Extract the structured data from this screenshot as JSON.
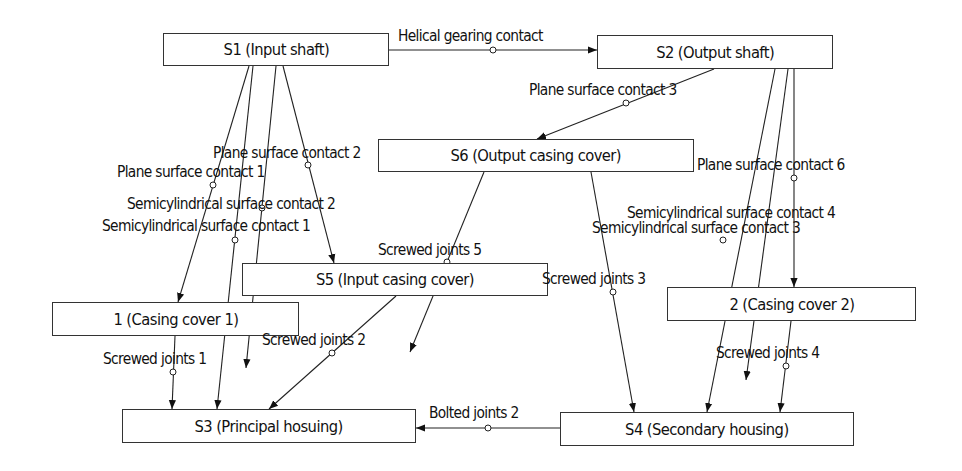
{
  "diagram": {
    "type": "assembly-liaison-graph",
    "nodes": [
      {
        "id": "S1",
        "label": "S1 (Input shaft)",
        "x": 163,
        "y": 33,
        "w": 226,
        "h": 33
      },
      {
        "id": "S2",
        "label": "S2 (Output shaft)",
        "x": 597,
        "y": 35,
        "w": 236,
        "h": 34
      },
      {
        "id": "S6",
        "label": "S6 (Output casing cover)",
        "x": 378,
        "y": 139,
        "w": 316,
        "h": 33
      },
      {
        "id": "S5",
        "label": "S5 (Input casing cover)",
        "x": 242,
        "y": 263,
        "w": 306,
        "h": 33
      },
      {
        "id": "C1",
        "label": "1 (Casing cover 1)",
        "x": 52,
        "y": 302,
        "w": 247,
        "h": 34
      },
      {
        "id": "C2",
        "label": "2 (Casing cover 2)",
        "x": 667,
        "y": 287,
        "w": 249,
        "h": 34
      },
      {
        "id": "S3",
        "label": "S3 (Principal hosuing)",
        "x": 122,
        "y": 409,
        "w": 294,
        "h": 34
      },
      {
        "id": "S4",
        "label": "S4 (Secondary housing)",
        "x": 560,
        "y": 412,
        "w": 294,
        "h": 34
      }
    ],
    "edges": [
      {
        "label": "Helical gearing contact",
        "from": "S1",
        "to": "S2",
        "x1": 389,
        "y1": 50,
        "x2": 597,
        "y2": 50,
        "mx": 493,
        "my": 50,
        "lx": 398,
        "ly": 28
      },
      {
        "label": "Plane surface contact 3",
        "from": "S2",
        "to": "S6",
        "x1": 714,
        "y1": 69,
        "x2": 537,
        "y2": 139,
        "mx": 626,
        "my": 103,
        "lx": 529,
        "ly": 82
      },
      {
        "label": "Plane surface contact 1",
        "from": "S1",
        "to": "C1",
        "x1": 249,
        "y1": 66,
        "x2": 178,
        "y2": 302,
        "mx": 213,
        "my": 185,
        "lx": 117,
        "ly": 164
      },
      {
        "label": "Semicylindrical surface contact 1",
        "from": "S1",
        "to": "S3",
        "x1": 253,
        "y1": 66,
        "x2": 217,
        "y2": 409,
        "mx": 235,
        "my": 240,
        "lx": 102,
        "ly": 218
      },
      {
        "label": "Semicylindrical surface contact 2",
        "from": "S1",
        "to": "",
        "x1": 276,
        "y1": 66,
        "x2": 246,
        "y2": 368,
        "mx": 262,
        "my": 208,
        "lx": 127,
        "ly": 196
      },
      {
        "label": "Plane surface contact 2",
        "from": "S1",
        "to": "S5",
        "x1": 283,
        "y1": 66,
        "x2": 334,
        "y2": 263,
        "mx": 308,
        "my": 165,
        "lx": 213,
        "ly": 145
      },
      {
        "label": "Screwed joints 5",
        "from": "S6",
        "to": "",
        "x1": 484,
        "y1": 172,
        "x2": 410,
        "y2": 352,
        "mx": 447,
        "my": 262,
        "lx": 378,
        "ly": 242
      },
      {
        "label": "Screwed joints 2",
        "from": "S5",
        "to": "S3",
        "x1": 396,
        "y1": 296,
        "x2": 269,
        "y2": 409,
        "mx": 332,
        "my": 353,
        "lx": 262,
        "ly": 332
      },
      {
        "label": "Screwed joints 1",
        "from": "C1",
        "to": "S3",
        "x1": 175,
        "y1": 336,
        "x2": 172,
        "y2": 409,
        "mx": 173,
        "my": 372,
        "lx": 103,
        "ly": 351
      },
      {
        "label": "Screwed joints 3",
        "from": "S6",
        "to": "S4",
        "x1": 591,
        "y1": 172,
        "x2": 634,
        "y2": 412,
        "mx": 613,
        "my": 292,
        "lx": 542,
        "ly": 271
      },
      {
        "label": "Plane surface contact 6",
        "from": "S2",
        "to": "C2",
        "x1": 794,
        "y1": 69,
        "x2": 794,
        "y2": 287,
        "mx": 794,
        "my": 178,
        "lx": 697,
        "ly": 157
      },
      {
        "label": "Semicylindrical surface contact 3",
        "from": "S2",
        "to": "S4",
        "x1": 775,
        "y1": 69,
        "x2": 707,
        "y2": 412,
        "mx": 723,
        "my": 240,
        "lx": 592,
        "ly": 220
      },
      {
        "label": "Semicylindrical surface contact 4",
        "from": "S2",
        "to": "",
        "x1": 788,
        "y1": 69,
        "x2": 746,
        "y2": 380,
        "mx": 770,
        "my": 230,
        "lx": 627,
        "ly": 205,
        "marker": false
      },
      {
        "label": "Screwed joints 4",
        "from": "C2",
        "to": "S4",
        "x1": 791,
        "y1": 321,
        "x2": 780,
        "y2": 412,
        "mx": 786,
        "my": 366,
        "lx": 716,
        "ly": 345
      },
      {
        "label": "Bolted joints 2",
        "from": "S4",
        "to": "S3",
        "x1": 560,
        "y1": 428,
        "x2": 416,
        "y2": 428,
        "mx": 488,
        "my": 428,
        "lx": 429,
        "ly": 405
      }
    ]
  }
}
